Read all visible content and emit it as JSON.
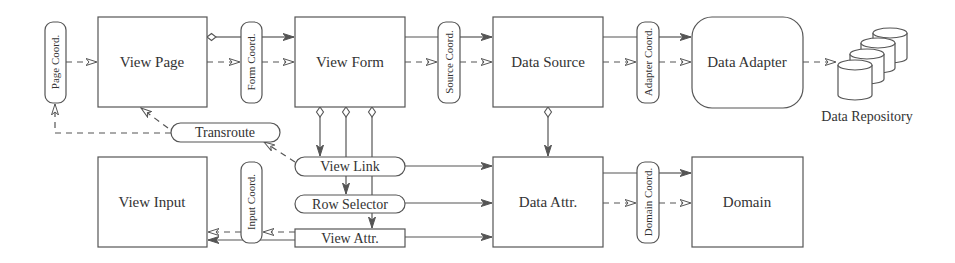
{
  "diagram": {
    "nodes": {
      "view_page": "View Page",
      "view_form": "View Form",
      "data_source": "Data Source",
      "data_adapter": "Data Adapter",
      "data_repository": "Data Repository",
      "view_input": "View Input",
      "data_attr": "Data Attr.",
      "domain": "Domain",
      "transroute": "Transroute",
      "view_link": "View Link",
      "row_selector": "Row Selector",
      "view_attr": "View Attr."
    },
    "coordinators": {
      "page_coord": "Page Coord.",
      "form_coord": "Form Coord.",
      "source_coord": "Source Coord.",
      "adapter_coord": "Adapter Coord.",
      "input_coord": "Input Coord.",
      "domain_coord": "Domain Coord."
    },
    "colors": {
      "stroke": "#555555",
      "text": "#333333",
      "background": "#ffffff"
    }
  }
}
